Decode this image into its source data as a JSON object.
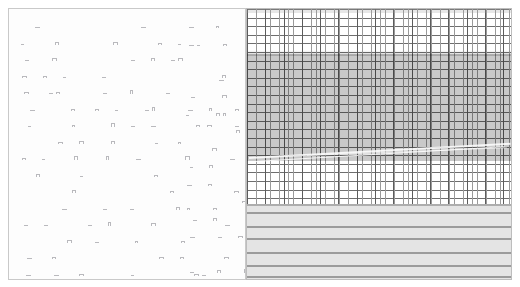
{
  "document": {
    "kind": "scanned-document-spread",
    "page_count": 2,
    "left_page": {
      "name": "text-page",
      "layout": "two-column",
      "legibility": "illegible-degraded-glyphs",
      "background_color": "#fdfdfd",
      "border_color": "#c9c9c9",
      "glyph_color": "#b9b9bd",
      "columns": [
        {
          "name": "column-left",
          "lines": [
            "..  .   ..  .",
            ". .. . .  . . .  . . .",
            ". . .  . . ..  .  .  .",
            ". . .  .. . .  .  .",
            ". ..  . .  .. . .  .",
            ".  . . . ..  . . . .",
            ". . .  . . .  .. .",
            ".. . . .  . .  . ..",
            ". .  .. . . . .  .",
            " .  .. .   .  .",
            ". . .  .  .   .",
            " . .  . .   .. ..",
            ". .  . .  .    .",
            "  . .  .  .   .",
            ". .  .  . . .  .",
            ". . .  .   .. ."
          ]
        },
        {
          "name": "column-right",
          "lines": [
            ". .   .",
            ".. . .  . .",
            ". . .  . .",
            ". . .  .",
            ". . .  .",
            ". ..  .",
            ".. . . ..",
            ". . . . .",
            ". .  .",
            ". .  .",
            ".  .  .",
            ". .  ..",
            ". . ..",
            "..",
            ". . ."
          ]
        }
      ]
    },
    "right_page": {
      "name": "ledger-sheet",
      "kind": "ruled-grid-table",
      "background_color": "#ffffff",
      "border_color": "#bdbdbd",
      "grid": {
        "name": "grid-zone",
        "vertical_rule_spacing_px": 4.6,
        "vertical_bold_rule_spacing_px": 18.3,
        "horizontal_rule_spacing_px": 8.6,
        "rule_color": "#6e6e6e",
        "bold_rule_color": "#5c5c5c",
        "height_px": 195
      },
      "shaded_block": {
        "name": "shaded-block",
        "top_px": 45,
        "height_px": 107,
        "shade_color": "#787878",
        "opacity": 0.4
      },
      "streaks": {
        "name": "diagonal-streak",
        "count": 3,
        "color": "#ffffff",
        "direction": "lower-left-to-upper-right"
      },
      "band_zone": {
        "name": "band-zone",
        "top_px": 195,
        "height_px": 77,
        "fill_color": "#e9e9e9",
        "rule_color": "#9b9b9b",
        "rule_offsets_px": [
          8,
          22,
          34,
          48,
          61,
          72
        ],
        "rule_count": 6
      }
    }
  }
}
